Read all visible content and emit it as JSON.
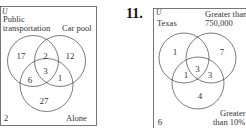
{
  "diagrams": [
    {
      "universe_label": "U",
      "sets": {
        "a": "Public\ntransportation",
        "a_line1": "Public",
        "a_line2": "transportation",
        "b": "Car pool",
        "c": "Alone"
      },
      "regions": {
        "a_only": "17",
        "ab_only": "2",
        "b_only": "12",
        "abc": "3",
        "ac_only": "6",
        "bc_only": "1",
        "c_only": "27",
        "outside": "2"
      }
    },
    {
      "problem_number": "11.",
      "universe_label": "U",
      "sets": {
        "a": "Texas",
        "b_line1": "Greater than",
        "b_line2": "750,000",
        "c_line1": "Greater",
        "c_line2": "than 10%"
      },
      "regions": {
        "a_only": "1",
        "ab_only": "",
        "b_only": "7",
        "abc": "3",
        "ac_only": "1",
        "bc_only": "3",
        "c_only": "4",
        "outside": "6"
      }
    }
  ]
}
